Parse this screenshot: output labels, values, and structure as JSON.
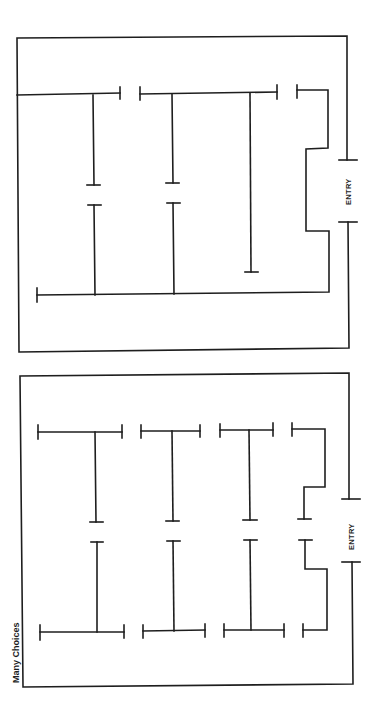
{
  "figure": {
    "panels": [
      {
        "id": "top",
        "layout": "few choices / long corridors",
        "entry_label": "ENTRY"
      },
      {
        "id": "bottom",
        "title": "Many Choices",
        "entry_label": "ENTRY"
      }
    ],
    "colors": {
      "line": "#1e1e1e",
      "background": "#ffffff"
    }
  }
}
